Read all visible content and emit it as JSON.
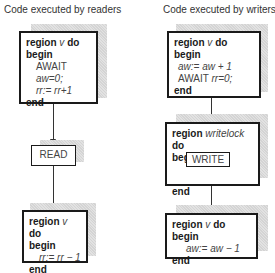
{
  "readers": {
    "title": "Code executed by readers",
    "entry_region": {
      "header_kw": "region",
      "header_var": "v",
      "header_do": "do",
      "begin": "begin",
      "line1_kw": "AWAIT",
      "line1_expr": "aw=0;",
      "line2_expr": "rr:= rr+1",
      "end": "end"
    },
    "action": "READ",
    "exit_region": {
      "header_kw": "region",
      "header_var": "v",
      "header_do": "do",
      "begin": "begin",
      "line1_expr": "rr:= rr − 1",
      "end": "end"
    }
  },
  "writers": {
    "title": "Code executed by writers",
    "entry_region": {
      "header_kw": "region",
      "header_var": "v",
      "header_do": "do",
      "begin": "begin",
      "line1_expr": "aw:= aw + 1",
      "line2_kw": "AWAIT",
      "line2_expr": "rr=0;",
      "end": "end"
    },
    "lock_region": {
      "header_kw": "region",
      "header_var": "writelock",
      "header_do": "do",
      "begin": "begin",
      "action": "WRITE",
      "end": "end"
    },
    "exit_region": {
      "header_kw": "region",
      "header_var": "v",
      "header_do": "do",
      "begin": "begin",
      "line1_expr": "aw:= aw − 1",
      "end": "end"
    }
  }
}
